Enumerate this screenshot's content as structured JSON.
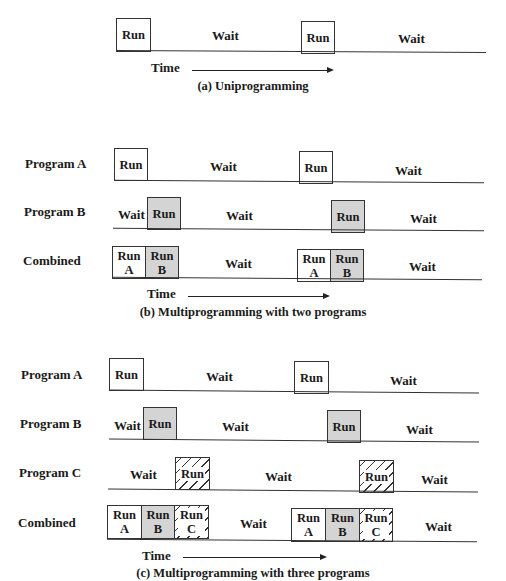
{
  "header_fragment": "……进程与线程 …… 17",
  "diagram_a": {
    "caption": "(a) Uniprogramming",
    "time_label": "Time",
    "row": {
      "segments": [
        "Run",
        "Wait",
        "Run",
        "Wait"
      ]
    }
  },
  "diagram_b": {
    "caption": "(b) Multiprogramming with two programs",
    "time_label": "Time",
    "rows": [
      {
        "label": "Program A",
        "segments": [
          "Run",
          "Wait",
          "Run",
          "Wait"
        ]
      },
      {
        "label": "Program B",
        "segments": [
          "Wait",
          "Run",
          "Wait",
          "Run",
          "Wait"
        ]
      },
      {
        "label": "Combined",
        "segments": [
          "Run A",
          "Run B",
          "Wait",
          "Run A",
          "Run B",
          "Wait"
        ]
      }
    ]
  },
  "diagram_c": {
    "caption": "(c) Multiprogramming with three programs",
    "time_label": "Time",
    "rows": [
      {
        "label": "Program A",
        "segments": [
          "Run",
          "Wait",
          "Run",
          "Wait"
        ]
      },
      {
        "label": "Program B",
        "segments": [
          "Wait",
          "Run",
          "Wait",
          "Run",
          "Wait"
        ]
      },
      {
        "label": "Program C",
        "segments": [
          "Wait",
          "Run",
          "Wait",
          "Run",
          "Wait"
        ]
      },
      {
        "label": "Combined",
        "segments": [
          "Run A",
          "Run B",
          "Run C",
          "Wait",
          "Run A",
          "Run B",
          "Run C",
          "Wait"
        ]
      }
    ]
  },
  "text": {
    "run": "Run",
    "wait": "Wait",
    "a": "A",
    "b": "B",
    "c": "C"
  },
  "colors": {
    "gray_fill": "#d4d4d4",
    "line": "#333333"
  }
}
